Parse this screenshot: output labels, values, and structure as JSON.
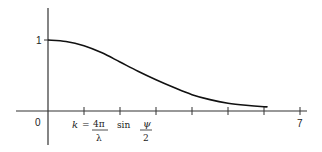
{
  "chart_data": {
    "type": "line",
    "title": "",
    "xlabel": "k = 4π/λ sin ψ/2",
    "xlabel_parts": {
      "k": "k",
      "eq": "=",
      "num": "4π",
      "den": "λ",
      "sin": "sin",
      "psi": "ψ",
      "two": "2"
    },
    "ylabel": "",
    "x_ticks": [
      0,
      1,
      2,
      3,
      4,
      5,
      6,
      7
    ],
    "x_tick_labels": {
      "origin": "0",
      "end": "7"
    },
    "y_tick_labels": {
      "one": "1"
    },
    "xlim": [
      0,
      7.2
    ],
    "ylim": [
      0,
      1.4
    ],
    "grid": false,
    "series": [
      {
        "name": "curve",
        "x": [
          0,
          0.5,
          1,
          1.5,
          2,
          2.5,
          3,
          3.5,
          4,
          4.5,
          5,
          5.5,
          6,
          6.1
        ],
        "values": [
          1.0,
          0.98,
          0.92,
          0.82,
          0.69,
          0.56,
          0.44,
          0.33,
          0.23,
          0.16,
          0.11,
          0.08,
          0.06,
          0.06
        ]
      }
    ]
  }
}
